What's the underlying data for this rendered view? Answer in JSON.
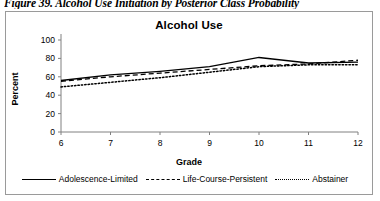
{
  "caption": "Figure 39. Alcohol Use Initiation by Posterior Class Probability",
  "chart_data": {
    "type": "line",
    "title": "Alcohol Use",
    "xlabel": "Grade",
    "ylabel": "Percent",
    "x": [
      6,
      7,
      8,
      9,
      10,
      11,
      12
    ],
    "categories": [
      "6",
      "7",
      "8",
      "9",
      "10",
      "11",
      "12"
    ],
    "xlim": [
      6,
      12
    ],
    "ylim": [
      0,
      100
    ],
    "yticks": [
      0,
      20,
      40,
      60,
      80,
      100
    ],
    "ytick_labels": [
      "0",
      "20",
      "40",
      "60",
      "80",
      "100"
    ],
    "xtick_labels": [
      "6",
      "7",
      "8",
      "9",
      "10",
      "11",
      "12"
    ],
    "grid": false,
    "legend_position": "bottom",
    "series": [
      {
        "name": "Adolescence-Limited",
        "style": "solid",
        "color": "#000000",
        "values": [
          56,
          62,
          66,
          71,
          81,
          75,
          76
        ]
      },
      {
        "name": "Life-Course-Persistent",
        "style": "dashed",
        "color": "#000000",
        "values": [
          55,
          60,
          64,
          68,
          72,
          74,
          78
        ]
      },
      {
        "name": "Abstainer",
        "style": "dotted",
        "color": "#000000",
        "values": [
          49,
          54,
          59,
          65,
          71,
          73,
          73
        ]
      }
    ]
  }
}
